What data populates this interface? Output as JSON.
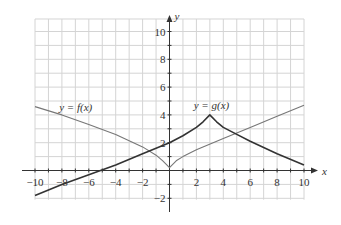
{
  "chart_data": {
    "type": "line",
    "title": "",
    "xlabel": "x",
    "ylabel": "y",
    "xlim": [
      -10,
      10
    ],
    "ylim": [
      -2,
      11
    ],
    "grid": true,
    "x_ticks": [
      -10,
      -8,
      -6,
      -4,
      -2,
      2,
      4,
      6,
      8,
      10
    ],
    "y_ticks": [
      -2,
      2,
      4,
      6,
      8,
      10
    ],
    "series": [
      {
        "name": "y = f(x)",
        "color": "#777777",
        "x": [
          -10,
          -8,
          -6,
          -4,
          -2,
          -1,
          -0.5,
          0,
          0.5,
          1,
          2,
          4,
          6,
          8,
          10
        ],
        "y": [
          4.6,
          4.0,
          3.3,
          2.6,
          1.7,
          1.1,
          0.7,
          0.2,
          0.7,
          1.0,
          1.5,
          2.3,
          3.1,
          3.9,
          4.7
        ]
      },
      {
        "name": "y = g(x)",
        "color": "#333333",
        "x": [
          -10,
          -8,
          -6,
          -4,
          -2,
          0,
          1,
          2,
          2.5,
          3,
          3.5,
          4,
          5,
          6,
          8,
          10
        ],
        "y": [
          -1.8,
          -1.0,
          -0.3,
          0.4,
          1.2,
          2.0,
          2.5,
          3.1,
          3.5,
          4.0,
          3.5,
          3.1,
          2.6,
          2.1,
          1.2,
          0.4
        ]
      }
    ],
    "annotations": [
      {
        "text": "y = f(x)",
        "x": -8,
        "y": 4.3
      },
      {
        "text": "y = g(x)",
        "x": 2.7,
        "y": 4.4
      }
    ]
  },
  "labels": {
    "x_axis": "x",
    "y_axis": "y",
    "f_label": "y = f(x)",
    "g_label": "y = g(x)"
  }
}
